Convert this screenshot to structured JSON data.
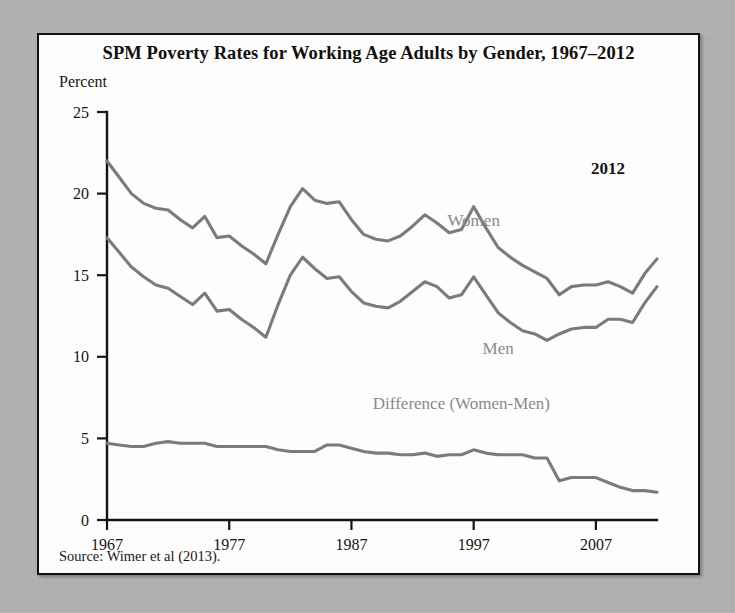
{
  "figure": {
    "title": "SPM Poverty Rates for Working Age Adults by Gender, 1967–2012",
    "y_axis_title": "Percent",
    "source_note": "Source: Wimer et al (2013).",
    "end_year_annotation": "2012"
  },
  "chart_data": {
    "type": "line",
    "title": "SPM Poverty Rates for Working Age Adults by Gender, 1967–2012",
    "xlabel": "",
    "ylabel": "Percent",
    "ylim": [
      0,
      25
    ],
    "xlim": [
      1967,
      2012
    ],
    "yticks": [
      0,
      5,
      10,
      15,
      20,
      25
    ],
    "xticks": [
      1967,
      1977,
      1987,
      1997,
      2007
    ],
    "grid": false,
    "legend": "inline-labels",
    "x": [
      1967,
      1968,
      1969,
      1970,
      1971,
      1972,
      1973,
      1974,
      1975,
      1976,
      1977,
      1978,
      1979,
      1980,
      1981,
      1982,
      1983,
      1984,
      1985,
      1986,
      1987,
      1988,
      1989,
      1990,
      1991,
      1992,
      1993,
      1994,
      1995,
      1996,
      1997,
      1998,
      1999,
      2000,
      2001,
      2002,
      2003,
      2004,
      2005,
      2006,
      2007,
      2008,
      2009,
      2010,
      2011,
      2012
    ],
    "series": [
      {
        "name": "Women",
        "label": "Women",
        "color": "#7b7b7b",
        "values": [
          22.0,
          21.0,
          20.0,
          19.4,
          19.1,
          19.0,
          18.4,
          17.9,
          18.6,
          17.3,
          17.4,
          16.8,
          16.3,
          15.7,
          17.5,
          19.2,
          20.3,
          19.6,
          19.4,
          19.5,
          18.4,
          17.5,
          17.2,
          17.1,
          17.4,
          18.0,
          18.7,
          18.2,
          17.6,
          17.8,
          19.2,
          17.9,
          16.7,
          16.1,
          15.6,
          15.2,
          14.8,
          13.8,
          14.3,
          14.4,
          14.4,
          14.6,
          14.3,
          13.9,
          15.1,
          16.0
        ]
      },
      {
        "name": "Men",
        "label": "Men",
        "color": "#7b7b7b",
        "values": [
          17.3,
          16.4,
          15.5,
          14.9,
          14.4,
          14.2,
          13.7,
          13.2,
          13.9,
          12.8,
          12.9,
          12.3,
          11.8,
          11.2,
          13.2,
          15.0,
          16.1,
          15.4,
          14.8,
          14.9,
          14.0,
          13.3,
          13.1,
          13.0,
          13.4,
          14.0,
          14.6,
          14.3,
          13.6,
          13.8,
          14.9,
          13.8,
          12.7,
          12.1,
          11.6,
          11.4,
          11.0,
          11.4,
          11.7,
          11.8,
          11.8,
          12.3,
          12.3,
          12.1,
          13.3,
          14.3
        ]
      },
      {
        "name": "Difference (Women-Men)",
        "label": "Difference (Women-Men)",
        "color": "#7b7b7b",
        "values": [
          4.7,
          4.6,
          4.5,
          4.5,
          4.7,
          4.8,
          4.7,
          4.7,
          4.7,
          4.5,
          4.5,
          4.5,
          4.5,
          4.5,
          4.3,
          4.2,
          4.2,
          4.2,
          4.6,
          4.6,
          4.4,
          4.2,
          4.1,
          4.1,
          4.0,
          4.0,
          4.1,
          3.9,
          4.0,
          4.0,
          4.3,
          4.1,
          4.0,
          4.0,
          4.0,
          3.8,
          3.8,
          2.4,
          2.6,
          2.6,
          2.6,
          2.3,
          2.0,
          1.8,
          1.8,
          1.7
        ]
      }
    ],
    "annotations": [
      {
        "text": "Women",
        "x": 1997,
        "y": 18.0
      },
      {
        "text": "Men",
        "x": 1999,
        "y": 10.2
      },
      {
        "text": "Difference (Women-Men)",
        "x": 1996,
        "y": 6.8
      },
      {
        "text": "2012",
        "x": 2008,
        "y": 21.2
      }
    ]
  }
}
